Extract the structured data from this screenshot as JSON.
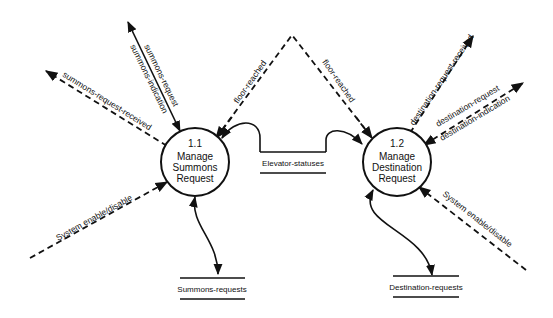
{
  "diagram": {
    "type": "data-flow-diagram",
    "processes": [
      {
        "id": "1.1",
        "number": "1.1",
        "line1": "Manage",
        "line2": "Summons",
        "line3": "Request"
      },
      {
        "id": "1.2",
        "number": "1.2",
        "line1": "Manage",
        "line2": "Destination",
        "line3": "Request"
      }
    ],
    "stores": [
      {
        "id": "elevator-statuses",
        "label": "Elevator-statuses"
      },
      {
        "id": "summons-requests",
        "label": "Summons-requests"
      },
      {
        "id": "destination-requests",
        "label": "Destination-requests"
      }
    ],
    "flows": {
      "summons_request": "summons-request",
      "summons_indication": "summons-indication",
      "summons_request_received": "summons-request-received",
      "floor_reached_left": "floor-reached",
      "floor_reached_right": "floor-reached",
      "system_enable_disable_left": "System enable/disable",
      "system_enable_disable_right": "System enable/disable",
      "destination_request_received": "destination-request-received",
      "destination_request": "destination-request",
      "destination_indication": "destination-indication"
    },
    "colors": {
      "line": "#111111",
      "background": "#ffffff"
    }
  }
}
